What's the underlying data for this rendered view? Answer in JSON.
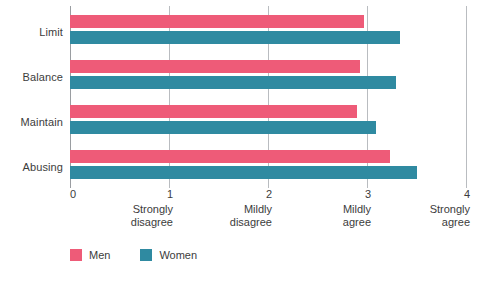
{
  "chart_data": {
    "type": "bar",
    "orientation": "horizontal",
    "title": "",
    "subtitle": "",
    "xlabel": "",
    "ylabel": "",
    "categories": [
      "Limit",
      "Balance",
      "Maintain",
      "Abusing"
    ],
    "series": [
      {
        "name": "Men",
        "color": "#ee5b78",
        "values": [
          2.97,
          2.93,
          2.9,
          3.23
        ]
      },
      {
        "name": "Women",
        "color": "#2f8aa1",
        "values": [
          3.33,
          3.29,
          3.09,
          3.5
        ]
      }
    ],
    "xlim": [
      0,
      4
    ],
    "xticks": [
      0,
      1,
      2,
      3,
      4
    ],
    "xtick_labels": [
      "0",
      "1",
      "2",
      "3",
      "4"
    ],
    "xtick_descriptions": [
      "",
      "Strongly\ndisagree",
      "Mildly\ndisagree",
      "Mildly\nagree",
      "Strongly\nagree"
    ],
    "grid": true,
    "grid_axis": "x",
    "legend_position": "bottom-left"
  },
  "axis": {
    "ticks": [
      {
        "num": "0",
        "desc": ""
      },
      {
        "num": "1",
        "desc": "Strongly\ndisagree"
      },
      {
        "num": "2",
        "desc": "Mildly\ndisagree"
      },
      {
        "num": "3",
        "desc": "Mildly\nagree"
      },
      {
        "num": "4",
        "desc": "Strongly\nagree"
      }
    ]
  },
  "legend": {
    "items": [
      {
        "label": "Men",
        "color": "#ee5b78"
      },
      {
        "label": "Women",
        "color": "#2f8aa1"
      }
    ]
  },
  "colors": {
    "men": "#ee5b78",
    "women": "#2f8aa1",
    "gridline": "#b9bcc0",
    "text": "#3c3c3c",
    "background": "#ffffff"
  }
}
